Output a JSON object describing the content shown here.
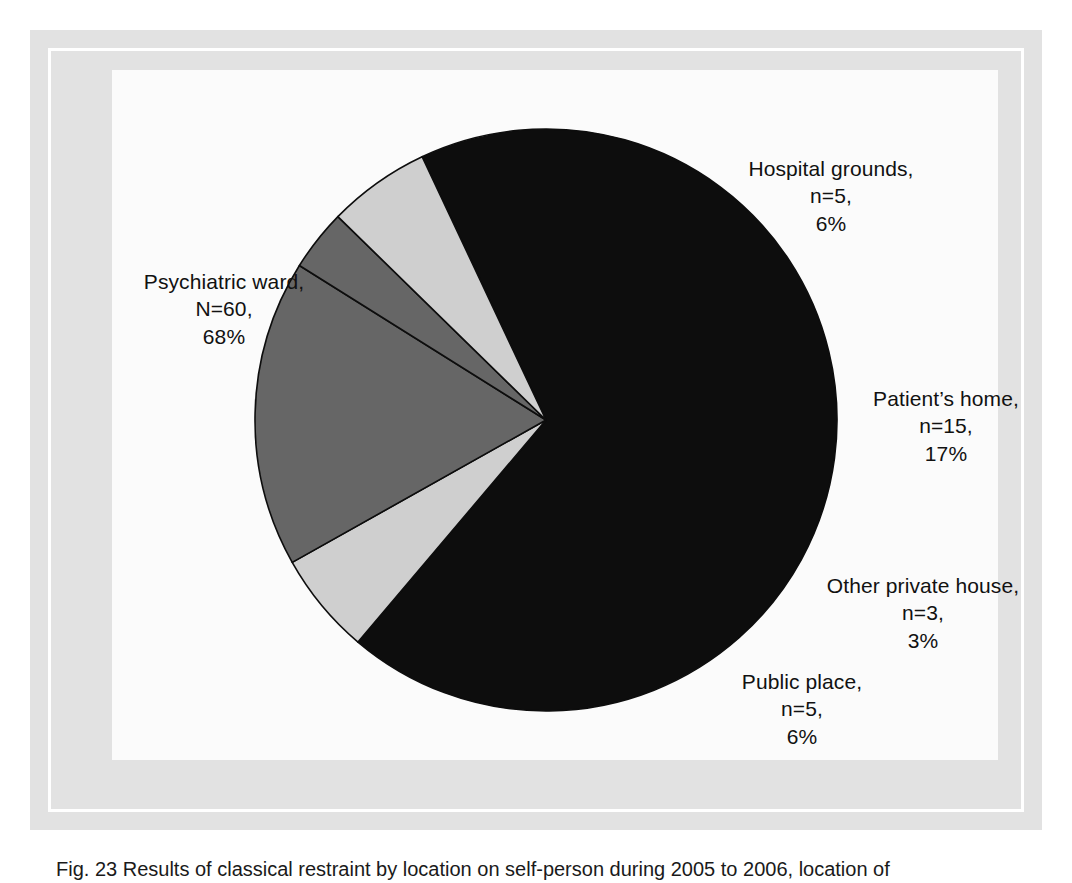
{
  "figure": {
    "caption": "Fig. 23  Results of classical restraint by location on self-person during 2005 to 2006, location of"
  },
  "chart_data": {
    "type": "pie",
    "title": "",
    "total_n": 88,
    "legend_position": "none",
    "labels": [
      "Psychiatric ward",
      "Hospital grounds",
      "Patient's home",
      "Other private house",
      "Public place"
    ],
    "values": [
      60,
      5,
      15,
      3,
      5
    ],
    "percentages": [
      68,
      6,
      17,
      3,
      6
    ],
    "colors": [
      "#0d0d0d",
      "#cfcfcf",
      "#666666",
      "#666666",
      "#cfcfcf"
    ],
    "slices": [
      {
        "name": "Psychiatric ward",
        "count_label": "N=60",
        "percent_label": "68%",
        "value": 60,
        "percent": 68,
        "color": "#0d0d0d",
        "start_angle_deg": 330.0,
        "end_angle_deg": 274.8
      },
      {
        "name": "Hospital grounds",
        "count_label": "n=5",
        "percent_label": "6%",
        "value": 5,
        "percent": 6,
        "color": "#cfcfcf",
        "start_angle_deg": 334.8,
        "end_angle_deg": 15.2
      },
      {
        "name": "Patient's home",
        "count_label": "n=15",
        "percent_label": "17%",
        "value": 15,
        "percent": 17,
        "color": "#666666",
        "start_angle_deg": 15.2,
        "end_angle_deg": 76.6
      },
      {
        "name": "Other private house",
        "count_label": "n=3",
        "percent_label": "3%",
        "value": 3,
        "percent": 3,
        "color": "#666666",
        "start_angle_deg": 76.6,
        "end_angle_deg": 88.9
      },
      {
        "name": "Public place",
        "count_label": "n=5",
        "percent_label": "6%",
        "value": 5,
        "percent": 6,
        "color": "#cfcfcf",
        "start_angle_deg": 88.9,
        "end_angle_deg": 109.3
      }
    ]
  },
  "labels": {
    "psychiatric_ward": {
      "name": "Psychiatric ward,",
      "n": "N=60,",
      "pct": "68%"
    },
    "hospital_grounds": {
      "name": "Hospital grounds,",
      "n": "n=5,",
      "pct": "6%"
    },
    "patients_home": {
      "name": "Patient’s home,",
      "n": "n=15,",
      "pct": "17%"
    },
    "other_private_house": {
      "name": "Other private house,",
      "n": "n=3,",
      "pct": "3%"
    },
    "public_place": {
      "name": "Public place,",
      "n": "n=5,",
      "pct": "6%"
    }
  },
  "geometry": {
    "center_x": 546,
    "center_y": 420,
    "radius": 291
  },
  "palette": {
    "dark_slice": "#0d0d0d",
    "mid_slice": "#666666",
    "light_slice": "#cfcfcf",
    "frame_band": "#e2e2e2",
    "plot_background": "#fbfbfb",
    "text": "#111111"
  }
}
